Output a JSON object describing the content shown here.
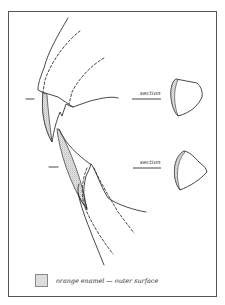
{
  "diagram": {
    "sections": [
      {
        "label": "section",
        "position": "upper"
      },
      {
        "label": "section",
        "position": "lower"
      }
    ],
    "legend": {
      "swatch_pattern": "stippled",
      "text": "orange enamel — outer surface"
    },
    "colors": {
      "line": "#333333",
      "enamel_stipple": "#aaaaaa",
      "frame": "#555555",
      "background": "#ffffff"
    }
  }
}
